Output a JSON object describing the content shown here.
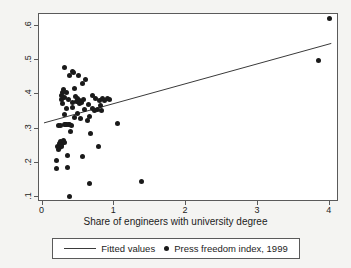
{
  "chart_data": {
    "type": "scatter",
    "title": "",
    "xlabel": "Share of engineers with university degree",
    "ylabel": "",
    "xlim": [
      -0.05,
      4.13
    ],
    "ylim": [
      0.085,
      0.635
    ],
    "xticks": [
      "0",
      "1",
      "2",
      "3",
      "4"
    ],
    "xtick_values": [
      0,
      1,
      2,
      3,
      4
    ],
    "yticks": [
      ".1",
      ".2",
      ".3",
      ".4",
      ".5",
      ".6"
    ],
    "ytick_values": [
      0.1,
      0.2,
      0.3,
      0.4,
      0.5,
      0.6
    ],
    "grid": false,
    "legend_position": "below-axes",
    "series": [
      {
        "name": "Fitted values",
        "type": "line",
        "marker": "line",
        "color": "#3a3a3a",
        "x": [
          0.02,
          4.05
        ],
        "y": [
          0.313,
          0.548
        ]
      },
      {
        "name": "Press freedom index, 1999",
        "type": "scatter",
        "marker": "filled-circle",
        "color": "#1a1a1a",
        "points": [
          [
            0.19,
            0.183
          ],
          [
            0.2,
            0.205
          ],
          [
            0.21,
            0.247
          ],
          [
            0.22,
            0.238
          ],
          [
            0.22,
            0.308
          ],
          [
            0.23,
            0.255
          ],
          [
            0.24,
            0.244
          ],
          [
            0.25,
            0.262
          ],
          [
            0.25,
            0.308
          ],
          [
            0.26,
            0.252
          ],
          [
            0.26,
            0.385
          ],
          [
            0.27,
            0.248
          ],
          [
            0.27,
            0.398
          ],
          [
            0.28,
            0.258
          ],
          [
            0.28,
            0.404
          ],
          [
            0.28,
            0.372
          ],
          [
            0.29,
            0.265
          ],
          [
            0.29,
            0.414
          ],
          [
            0.3,
            0.259
          ],
          [
            0.3,
            0.391
          ],
          [
            0.3,
            0.479
          ],
          [
            0.31,
            0.311
          ],
          [
            0.31,
            0.342
          ],
          [
            0.32,
            0.313
          ],
          [
            0.33,
            0.358
          ],
          [
            0.33,
            0.405
          ],
          [
            0.34,
            0.313
          ],
          [
            0.35,
            0.185
          ],
          [
            0.35,
            0.221
          ],
          [
            0.36,
            0.312
          ],
          [
            0.36,
            0.384
          ],
          [
            0.37,
            0.311
          ],
          [
            0.38,
            0.101
          ],
          [
            0.38,
            0.455
          ],
          [
            0.39,
            0.291
          ],
          [
            0.4,
            0.309
          ],
          [
            0.41,
            0.362
          ],
          [
            0.42,
            0.375
          ],
          [
            0.42,
            0.468
          ],
          [
            0.43,
            0.464
          ],
          [
            0.44,
            0.416
          ],
          [
            0.45,
            0.332
          ],
          [
            0.46,
            0.394
          ],
          [
            0.47,
            0.38
          ],
          [
            0.48,
            0.389
          ],
          [
            0.49,
            0.345
          ],
          [
            0.5,
            0.378
          ],
          [
            0.5,
            0.456
          ],
          [
            0.51,
            0.383
          ],
          [
            0.52,
            0.372
          ],
          [
            0.53,
            0.329
          ],
          [
            0.54,
            0.376
          ],
          [
            0.55,
            0.432
          ],
          [
            0.56,
            0.219
          ],
          [
            0.57,
            0.386
          ],
          [
            0.58,
            0.357
          ],
          [
            0.6,
            0.443
          ],
          [
            0.62,
            0.323
          ],
          [
            0.64,
            0.371
          ],
          [
            0.65,
            0.335
          ],
          [
            0.66,
            0.139
          ],
          [
            0.67,
            0.286
          ],
          [
            0.69,
            0.396
          ],
          [
            0.7,
            0.358
          ],
          [
            0.72,
            0.352
          ],
          [
            0.74,
            0.387
          ],
          [
            0.76,
            0.355
          ],
          [
            0.78,
            0.247
          ],
          [
            0.79,
            0.382
          ],
          [
            0.8,
            0.367
          ],
          [
            0.82,
            0.352
          ],
          [
            0.84,
            0.389
          ],
          [
            0.86,
            0.383
          ],
          [
            0.9,
            0.387
          ],
          [
            0.93,
            0.386
          ],
          [
            1.05,
            0.316
          ],
          [
            1.38,
            0.146
          ],
          [
            3.84,
            0.5
          ],
          [
            4.0,
            0.622
          ]
        ]
      }
    ]
  },
  "legend": {
    "fitted_label": "Fitted values",
    "scatter_label": "Press freedom index, 1999"
  }
}
